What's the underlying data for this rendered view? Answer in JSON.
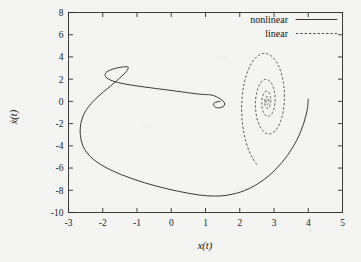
{
  "chart_data": {
    "type": "line",
    "title": "",
    "xlabel": "x(t)",
    "ylabel": "ẋ(t)",
    "xlim": [
      -3,
      5
    ],
    "ylim": [
      -10,
      8
    ],
    "xticks": [
      -3,
      -2,
      -1,
      0,
      1,
      2,
      3,
      4,
      5
    ],
    "yticks": [
      -10,
      -8,
      -6,
      -4,
      -2,
      0,
      2,
      4,
      6,
      8
    ],
    "xtick_labels": [
      "-3",
      "-2",
      "-1",
      "0",
      "1",
      "2",
      "3",
      "4",
      "5"
    ],
    "ytick_labels": [
      "-10",
      "-8",
      "-6",
      "-4",
      "-2",
      "0",
      "2",
      "4",
      "6",
      "8"
    ],
    "grid": false,
    "legend_position": "top-right",
    "legend": [
      {
        "name": "nonlinear",
        "style": "solid"
      },
      {
        "name": "linear",
        "style": "dashed"
      }
    ],
    "series": [
      {
        "name": "nonlinear",
        "style": "solid",
        "comment": "phase-plane trajectory: starts (4.00, 0.20), large clockwise excursion, converges to focus near (1.40, 0.00)",
        "points": [
          [
            4.0,
            0.2
          ],
          [
            3.98,
            -0.55
          ],
          [
            3.93,
            -1.3
          ],
          [
            3.86,
            -2.05
          ],
          [
            3.77,
            -2.8
          ],
          [
            3.66,
            -3.52
          ],
          [
            3.53,
            -4.22
          ],
          [
            3.39,
            -4.88
          ],
          [
            3.23,
            -5.5
          ],
          [
            3.06,
            -6.08
          ],
          [
            2.88,
            -6.62
          ],
          [
            2.68,
            -7.1
          ],
          [
            2.47,
            -7.52
          ],
          [
            2.25,
            -7.88
          ],
          [
            2.02,
            -8.16
          ],
          [
            1.78,
            -8.36
          ],
          [
            1.54,
            -8.48
          ],
          [
            1.3,
            -8.52
          ],
          [
            1.06,
            -8.5
          ],
          [
            0.8,
            -8.42
          ],
          [
            0.52,
            -8.28
          ],
          [
            0.22,
            -8.1
          ],
          [
            -0.1,
            -7.88
          ],
          [
            -0.44,
            -7.62
          ],
          [
            -0.78,
            -7.32
          ],
          [
            -1.12,
            -6.98
          ],
          [
            -1.45,
            -6.6
          ],
          [
            -1.76,
            -6.18
          ],
          [
            -2.04,
            -5.72
          ],
          [
            -2.28,
            -5.2
          ],
          [
            -2.46,
            -4.62
          ],
          [
            -2.58,
            -4.0
          ],
          [
            -2.64,
            -3.34
          ],
          [
            -2.66,
            -2.66
          ],
          [
            -2.64,
            -2.0
          ],
          [
            -2.58,
            -1.36
          ],
          [
            -2.48,
            -0.76
          ],
          [
            -2.34,
            -0.2
          ],
          [
            -2.17,
            0.34
          ],
          [
            -1.98,
            0.86
          ],
          [
            -1.78,
            1.36
          ],
          [
            -1.6,
            1.84
          ],
          [
            -1.44,
            2.28
          ],
          [
            -1.32,
            2.66
          ],
          [
            -1.26,
            2.94
          ],
          [
            -1.26,
            3.08
          ],
          [
            -1.33,
            3.12
          ],
          [
            -1.46,
            3.08
          ],
          [
            -1.62,
            2.98
          ],
          [
            -1.78,
            2.82
          ],
          [
            -1.9,
            2.6
          ],
          [
            -1.93,
            2.34
          ],
          [
            -1.88,
            2.1
          ],
          [
            -1.76,
            1.9
          ],
          [
            -1.58,
            1.72
          ],
          [
            -1.34,
            1.56
          ],
          [
            -1.06,
            1.42
          ],
          [
            -0.74,
            1.28
          ],
          [
            -0.4,
            1.14
          ],
          [
            -0.04,
            1.0
          ],
          [
            0.3,
            0.86
          ],
          [
            0.58,
            0.74
          ],
          [
            0.8,
            0.66
          ],
          [
            0.96,
            0.62
          ],
          [
            1.08,
            0.6
          ],
          [
            1.16,
            0.58
          ],
          [
            1.24,
            0.52
          ],
          [
            1.32,
            0.42
          ],
          [
            1.4,
            0.28
          ],
          [
            1.48,
            0.12
          ],
          [
            1.54,
            -0.06
          ],
          [
            1.56,
            -0.24
          ],
          [
            1.54,
            -0.4
          ],
          [
            1.48,
            -0.52
          ],
          [
            1.4,
            -0.58
          ],
          [
            1.32,
            -0.56
          ],
          [
            1.26,
            -0.46
          ],
          [
            1.23,
            -0.32
          ],
          [
            1.24,
            -0.18
          ],
          [
            1.29,
            -0.08
          ],
          [
            1.35,
            -0.03
          ],
          [
            1.4,
            -0.01
          ],
          [
            1.43,
            0.0
          ]
        ]
      },
      {
        "name": "linear",
        "style": "dashed",
        "comment": "linearized solution: clockwise inward logarithmic spiral about fixed point (2.80, 0.00); starts near (3.55, -7.25) and converges",
        "spiral": {
          "center": [
            2.8,
            0.0
          ],
          "a_start": 0.86,
          "b_start": 6.05,
          "decay_per_turn": 0.46,
          "turns": 4.6,
          "theta0": -1.92,
          "direction": "clockwise"
        }
      }
    ]
  }
}
